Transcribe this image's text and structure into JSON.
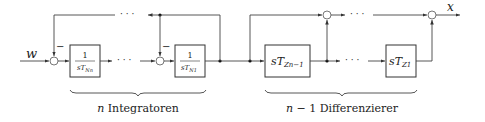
{
  "diagram": {
    "input_label": "w",
    "output_label": "x",
    "minus_sign": "−",
    "dots": "· · ·",
    "blocks": [
      {
        "id": "integrator-n",
        "numerator": "1",
        "denominator_main": "sT",
        "denominator_sub": "Nn"
      },
      {
        "id": "integrator-1",
        "numerator": "1",
        "denominator_main": "sT",
        "denominator_sub": "N1"
      },
      {
        "id": "differentiator-n-1",
        "main": "sT",
        "sub": "Zn−1"
      },
      {
        "id": "differentiator-1",
        "main": "sT",
        "sub": "Z1"
      }
    ],
    "braces": [
      {
        "var": "n",
        "label": " Integratoren"
      },
      {
        "var": "n",
        "label": " − 1 Differenzierer"
      }
    ]
  }
}
